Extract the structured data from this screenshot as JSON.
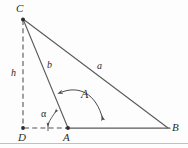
{
  "figure": {
    "type": "geometry-diagram",
    "canvas": {
      "width": 188,
      "height": 148
    },
    "stroke_color": "#5a5a5a",
    "label_color": "#2b2b2b",
    "background_color": "#fdfdfd",
    "vertices": [
      {
        "id": "C",
        "label": "C",
        "x": 23,
        "y": 19,
        "dot": true
      },
      {
        "id": "D",
        "label": "D",
        "x": 23,
        "y": 128,
        "dot": true
      },
      {
        "id": "A",
        "label": "A",
        "x": 68,
        "y": 128,
        "dot": true
      },
      {
        "id": "B",
        "label": "B",
        "x": 168,
        "y": 128,
        "dot": false
      }
    ],
    "segments": [
      {
        "id": "CB",
        "from": "C",
        "to": "B",
        "style": "solid",
        "label": "a"
      },
      {
        "id": "CA",
        "from": "C",
        "to": "A",
        "style": "solid",
        "label": "b"
      },
      {
        "id": "CD",
        "from": "C",
        "to": "D",
        "style": "dashed",
        "label": "h"
      },
      {
        "id": "DB",
        "from": "D",
        "to": "B",
        "style": "solid-with-dashed-DA",
        "label": ""
      }
    ],
    "side_labels": [
      {
        "id": "a",
        "label": "a",
        "x": 97,
        "y": 61
      },
      {
        "id": "b",
        "label": "b",
        "x": 47,
        "y": 60
      },
      {
        "id": "h",
        "label": "h",
        "x": 11,
        "y": 68
      }
    ],
    "angle_labels": [
      {
        "id": "A",
        "label": "A",
        "x": 81,
        "y": 88,
        "note": "interior angle at A, double-headed arc from CA to AB"
      },
      {
        "id": "alpha",
        "label": "α",
        "x": 41,
        "y": 109,
        "note": "angle between DA extension and AC"
      }
    ],
    "bottom_rule": {
      "y": 143,
      "color": "#b9c3cb"
    }
  }
}
